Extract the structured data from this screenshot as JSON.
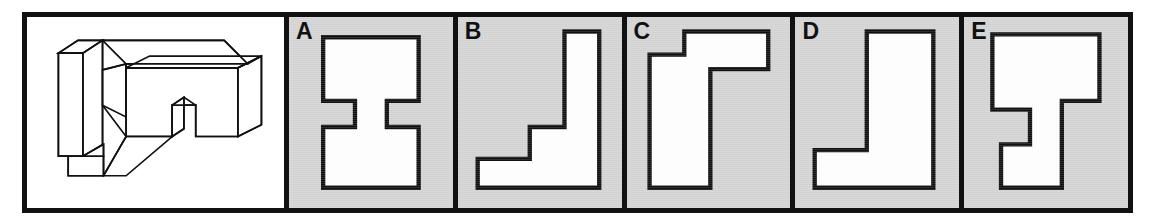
{
  "colors": {
    "page_background": "#ffffff",
    "panel_border": "#111111",
    "option_panel_fill": "#d4d4d4",
    "shape_fill": "#ffffff",
    "shape_stroke": "#111111",
    "stimulus_panel_fill": "#ffffff",
    "label_color": "#111111"
  },
  "stimulus": {
    "name": "isometric-solid",
    "description": "Three-dimensional block figure drawn in isometric line art",
    "stroke_color": "#111111",
    "fill_color": "#ffffff"
  },
  "options": [
    {
      "letter": "A",
      "shape_name": "i-beam-silhouette",
      "description": "Symmetric I-beam / H shape with notches on left and right of the middle band",
      "points": "18,14 84,14 84,58 62,58 62,76 84,76 84,118 18,118 18,76 40,76 40,58 18,58"
    },
    {
      "letter": "B",
      "shape_name": "staircase-silhouette",
      "description": "Two-step staircase rising left to right with tall right column",
      "points": "8,98 44,98 44,76 68,76 68,10 92,10 92,118 8,118"
    },
    {
      "letter": "C",
      "shape_name": "r-shape-silhouette",
      "description": "Inverted-L / lowercase r shape with top arm extending right",
      "points": "10,26 34,26 34,10 92,10 92,36 52,36 52,118 10,118"
    },
    {
      "letter": "D",
      "shape_name": "j-shape-silhouette",
      "description": "J shape: tall right column with foot extending to the left at the bottom",
      "points": "44,10 90,10 90,118 8,118 8,92 44,92"
    },
    {
      "letter": "E",
      "shape_name": "notched-t-silhouette",
      "description": "Blocky T shape with a rectangular notch cut into the lower left side",
      "points": "14,12 88,12 88,58 62,58 62,118 20,118 20,88 40,88 40,64 14,64"
    }
  ]
}
